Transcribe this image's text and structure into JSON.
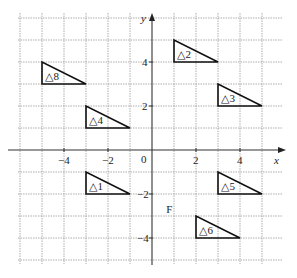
{
  "diagram": {
    "type": "coordinate-grid-transformations",
    "axes": {
      "x_label": "x",
      "y_label": "y",
      "x_range": [
        -6,
        6
      ],
      "y_range": [
        -5,
        6
      ],
      "x_ticks": [
        {
          "value": -4,
          "label": "−4"
        },
        {
          "value": -2,
          "label": "−2"
        },
        {
          "value": 2,
          "label": "2"
        },
        {
          "value": 4,
          "label": "4"
        }
      ],
      "y_ticks": [
        {
          "value": 4,
          "label": "4"
        },
        {
          "value": 2,
          "label": "2"
        },
        {
          "value": -2,
          "label": "−2"
        },
        {
          "value": -4,
          "label": "−4"
        }
      ],
      "origin_label": "0"
    },
    "triangles": [
      {
        "label": "△1",
        "vertices": [
          [
            -3,
            -1
          ],
          [
            -3,
            -2
          ],
          [
            -1,
            -2
          ]
        ]
      },
      {
        "label": "△2",
        "vertices": [
          [
            1,
            5
          ],
          [
            1,
            4
          ],
          [
            3,
            4
          ]
        ]
      },
      {
        "label": "△3",
        "vertices": [
          [
            3,
            3
          ],
          [
            3,
            2
          ],
          [
            5,
            2
          ]
        ]
      },
      {
        "label": "△4",
        "vertices": [
          [
            -3,
            2
          ],
          [
            -3,
            1
          ],
          [
            -1,
            1
          ]
        ]
      },
      {
        "label": "△5",
        "vertices": [
          [
            3,
            -1
          ],
          [
            3,
            -2
          ],
          [
            5,
            -2
          ]
        ]
      },
      {
        "label": "△6",
        "vertices": [
          [
            2,
            -3
          ],
          [
            2,
            -4
          ],
          [
            4,
            -4
          ]
        ]
      },
      {
        "label": "△8",
        "vertices": [
          [
            -5,
            4
          ],
          [
            -5,
            3
          ],
          [
            -3,
            3
          ]
        ]
      }
    ],
    "point_labels": [
      {
        "label": "F",
        "x": 0.65,
        "y": -2.7
      }
    ]
  }
}
